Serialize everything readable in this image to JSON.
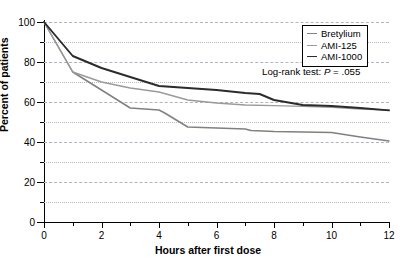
{
  "chart_data": {
    "type": "line",
    "title": "",
    "xlabel": "Hours after first dose",
    "ylabel": "Percent of patients",
    "xlim": [
      0,
      12
    ],
    "ylim": [
      0,
      100
    ],
    "xticks": [
      0,
      2,
      4,
      6,
      8,
      10,
      12
    ],
    "xticklabels": [
      "0",
      "2",
      "4",
      "6",
      "8",
      "10",
      "12"
    ],
    "xminor_ticks": [
      1,
      3,
      5,
      7,
      9,
      11
    ],
    "yticks": [
      0,
      20,
      40,
      60,
      80,
      100
    ],
    "yticklabels": [
      "0",
      "20",
      "40",
      "60",
      "80",
      "100"
    ],
    "yminor_ticks": [
      10,
      30,
      50,
      70,
      90
    ],
    "grid": true,
    "grid_axis": "y",
    "legend_position": "top-right",
    "annotations": [
      {
        "name": "log-rank-test",
        "text_prefix": "Log-rank test: ",
        "text_italic": "P",
        "text_suffix": " = .055"
      }
    ],
    "series": [
      {
        "name": "Bretylium",
        "color": "#808080",
        "x": [
          0,
          1,
          1.5,
          3,
          4,
          4.2,
          5,
          6,
          7,
          7.2,
          8,
          9,
          10,
          11,
          12
        ],
        "y": [
          100,
          75,
          70.5,
          57,
          56,
          54.5,
          47.5,
          47,
          46.5,
          45.8,
          45.3,
          45,
          44.8,
          42.5,
          40.5
        ]
      },
      {
        "name": "AMI-125",
        "color": "#9a9a9a",
        "x": [
          0,
          1,
          1.5,
          2,
          3,
          4,
          5,
          6,
          7,
          8,
          9,
          10,
          11,
          12
        ],
        "y": [
          100,
          75,
          72.5,
          70,
          67,
          65,
          61,
          59.5,
          58.5,
          58.2,
          57.8,
          57.3,
          56.5,
          56
        ]
      },
      {
        "name": "AMI-1000",
        "color": "#2b2b2b",
        "x": [
          0,
          1,
          2,
          3,
          4,
          5,
          6,
          7,
          7.5,
          8,
          9,
          10,
          11,
          12
        ],
        "y": [
          100,
          83,
          77,
          72.5,
          68,
          67,
          66,
          64.5,
          64,
          61,
          58.5,
          58,
          57,
          55.8
        ]
      }
    ]
  }
}
